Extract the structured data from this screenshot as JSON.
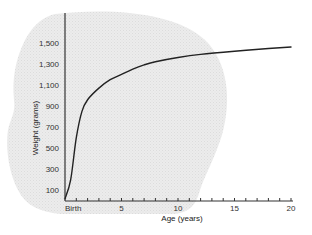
{
  "chart_data": {
    "type": "line",
    "title": "",
    "xlabel": "Age (years)",
    "ylabel": "Weight (grams)",
    "x_tick_labels": [
      "Birth",
      "5",
      "10",
      "15",
      "20"
    ],
    "x_ticks": [
      0,
      5,
      10,
      15,
      20
    ],
    "y_tick_labels": [
      "100",
      "300",
      "500",
      "700",
      "900",
      "1,100",
      "1,300",
      "1,500"
    ],
    "y_ticks": [
      100,
      300,
      500,
      700,
      900,
      1100,
      1300,
      1500
    ],
    "xlim": [
      0,
      20
    ],
    "ylim": [
      0,
      1700
    ],
    "grid": false,
    "legend": null,
    "background_shape": "head silhouette (light gray, stippled)",
    "series": [
      {
        "name": "Brain weight",
        "x": [
          0,
          0.5,
          1,
          1.5,
          2,
          3,
          4,
          5,
          6,
          7,
          8,
          10,
          12,
          15,
          18,
          20
        ],
        "values": [
          20,
          200,
          600,
          850,
          960,
          1070,
          1150,
          1200,
          1250,
          1290,
          1320,
          1360,
          1390,
          1420,
          1445,
          1460
        ]
      }
    ],
    "colors": {
      "line": "#222222",
      "axis": "#333333",
      "shape": "#e8e8e8"
    }
  }
}
